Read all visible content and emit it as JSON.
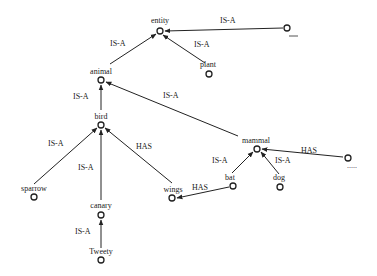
{
  "diagram": {
    "type": "semantic-network",
    "nodes": [
      {
        "id": "entity",
        "label": "entity",
        "x": 160,
        "y": 31
      },
      {
        "id": "unnamed1",
        "label": "____",
        "x": 287,
        "y": 28
      },
      {
        "id": "plant",
        "label": "plant",
        "x": 209,
        "y": 74
      },
      {
        "id": "animal",
        "label": "animal",
        "x": 101,
        "y": 80
      },
      {
        "id": "bird",
        "label": "bird",
        "x": 101,
        "y": 125
      },
      {
        "id": "mammal",
        "label": "mammal",
        "x": 257,
        "y": 149
      },
      {
        "id": "unnamed2",
        "label": ".....",
        "x": 348,
        "y": 158
      },
      {
        "id": "bat",
        "label": "bat",
        "x": 233,
        "y": 186
      },
      {
        "id": "dog",
        "label": "dog",
        "x": 280,
        "y": 187
      },
      {
        "id": "sparrow",
        "label": "sparrow",
        "x": 34,
        "y": 197
      },
      {
        "id": "wings",
        "label": "wings",
        "x": 172,
        "y": 198
      },
      {
        "id": "canary",
        "label": "canary",
        "x": 101,
        "y": 215
      },
      {
        "id": "tweety",
        "label": "Tweety",
        "x": 101,
        "y": 260
      }
    ],
    "edges": [
      {
        "from": "unnamed1",
        "to": "entity",
        "label": "IS-A"
      },
      {
        "from": "plant",
        "to": "entity",
        "label": "IS-A"
      },
      {
        "from": "animal",
        "to": "entity",
        "label": "IS-A"
      },
      {
        "from": "bird",
        "to": "animal",
        "label": "IS-A"
      },
      {
        "from": "mammal",
        "to": "animal",
        "label": "IS-A"
      },
      {
        "from": "sparrow",
        "to": "bird",
        "label": "IS-A"
      },
      {
        "from": "canary",
        "to": "bird",
        "label": "IS-A"
      },
      {
        "from": "wings",
        "to": "bird",
        "label": "HAS"
      },
      {
        "from": "bat",
        "to": "mammal",
        "label": "IS-A"
      },
      {
        "from": "dog",
        "to": "mammal",
        "label": "IS-A"
      },
      {
        "from": "unnamed2",
        "to": "mammal",
        "label": "HAS"
      },
      {
        "from": "bat",
        "to": "wings",
        "label": "HAS"
      },
      {
        "from": "tweety",
        "to": "canary",
        "label": "IS-A"
      }
    ],
    "text": {
      "entity": "entity",
      "plant": "plant",
      "animal": "animal",
      "bird": "bird",
      "mammal": "mammal",
      "bat": "bat",
      "dog": "dog",
      "sparrow": "sparrow",
      "wings": "wings",
      "canary": "canary",
      "tweety": "Tweety",
      "unnamed2_dots": ".....",
      "is_a": "IS-A",
      "has": "HAS"
    }
  }
}
